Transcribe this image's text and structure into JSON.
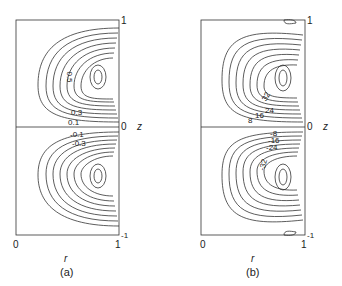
{
  "panels": [
    {
      "id": "a",
      "caption": "(a)",
      "x_axis": {
        "label": "r",
        "ticks": [
          "0",
          "1"
        ]
      },
      "z_axis": {
        "label": "z",
        "ticks": [
          "1",
          "0",
          "-1"
        ]
      },
      "contour_labels_top": [
        "0.5",
        "0.3",
        "0.1"
      ],
      "contour_labels_bottom": [
        "-0.1",
        "-0.3"
      ]
    },
    {
      "id": "b",
      "caption": "(b)",
      "x_axis": {
        "label": "r",
        "ticks": [
          "0",
          "1"
        ]
      },
      "z_axis": {
        "label": "z",
        "ticks": [
          "1",
          "0",
          "-1"
        ]
      },
      "contour_labels_top": [
        "32",
        "24",
        "16",
        "8"
      ],
      "contour_labels_bottom": [
        "-8",
        "-16",
        "-24",
        "-32"
      ]
    }
  ]
}
